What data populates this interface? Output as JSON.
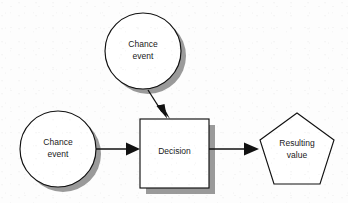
{
  "diagram": {
    "type": "flowchart",
    "background_color": "#fdfdfd",
    "line_color": "#111111",
    "shadow_color": "#9a9a9a",
    "fill_color": "#ffffff",
    "nodes": [
      {
        "id": "chance-event-top",
        "shape": "circle",
        "label_line1": "Chance",
        "label_line2": "event",
        "has_shadow": true,
        "cx": 143,
        "cy": 51,
        "r": 38
      },
      {
        "id": "chance-event-left",
        "shape": "circle",
        "label_line1": "Chance",
        "label_line2": "event",
        "has_shadow": true,
        "cx": 58,
        "cy": 149,
        "r": 38
      },
      {
        "id": "decision",
        "shape": "square",
        "label_line1": "Decision",
        "label_line2": "",
        "has_shadow": true,
        "x": 140,
        "y": 119,
        "w": 69,
        "h": 69
      },
      {
        "id": "resulting-value",
        "shape": "pentagon",
        "label_line1": "Resulting",
        "label_line2": "value",
        "has_shadow": false,
        "cx": 297,
        "cy": 152,
        "r": 39
      }
    ],
    "connectors": [
      {
        "id": "top-chance-to-decision",
        "from": "chance-event-top",
        "to": "decision",
        "orientation": "vertical-slanted",
        "arrowhead": "solid-triangle"
      },
      {
        "id": "left-chance-to-decision",
        "from": "chance-event-left",
        "to": "decision",
        "orientation": "horizontal",
        "arrowhead": "solid-triangle"
      },
      {
        "id": "decision-to-resulting-value",
        "from": "decision",
        "to": "resulting-value",
        "orientation": "horizontal",
        "arrowhead": "solid-triangle"
      }
    ]
  }
}
